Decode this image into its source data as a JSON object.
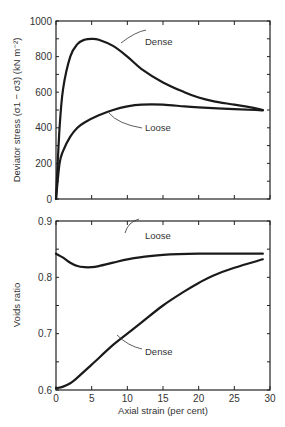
{
  "chart_data": [
    {
      "type": "line",
      "title": "",
      "xlabel": "",
      "ylabel": "Deviator stress (σ1 − σ3) (kN m⁻²)",
      "xlim": [
        0,
        30
      ],
      "ylim": [
        0,
        1000
      ],
      "yticks": [
        "0",
        "200",
        "400",
        "600",
        "800",
        "1000"
      ],
      "grid": false,
      "series": [
        {
          "name": "Dense",
          "x": [
            0,
            0.5,
            1,
            2,
            3,
            4,
            5,
            6,
            8,
            10,
            12,
            15,
            18,
            20,
            22,
            25,
            28,
            29
          ],
          "y": [
            0,
            400,
            620,
            800,
            870,
            895,
            900,
            895,
            860,
            800,
            730,
            655,
            600,
            570,
            550,
            530,
            510,
            500
          ]
        },
        {
          "name": "Loose",
          "x": [
            0,
            0.5,
            1,
            2,
            3,
            4,
            6,
            8,
            10,
            12,
            15,
            18,
            20,
            25,
            28,
            29
          ],
          "y": [
            0,
            200,
            270,
            350,
            400,
            430,
            470,
            500,
            520,
            530,
            530,
            520,
            515,
            505,
            500,
            498
          ]
        }
      ],
      "annotations": [
        "Dense",
        "Loose"
      ]
    },
    {
      "type": "line",
      "title": "",
      "xlabel": "Axial strain (per cent)",
      "ylabel": "Voids ratio",
      "xlim": [
        0,
        30
      ],
      "ylim": [
        0.6,
        0.9
      ],
      "xticks": [
        "0",
        "5",
        "10",
        "15",
        "20",
        "25",
        "30"
      ],
      "yticks": [
        "0.6",
        "0.7",
        "0.8",
        "0.9"
      ],
      "grid": false,
      "series": [
        {
          "name": "Loose",
          "x": [
            0,
            1,
            2,
            3,
            4,
            5,
            6,
            8,
            10,
            12,
            15,
            20,
            25,
            29
          ],
          "y": [
            0.842,
            0.835,
            0.826,
            0.82,
            0.818,
            0.818,
            0.82,
            0.826,
            0.832,
            0.836,
            0.84,
            0.842,
            0.842,
            0.842
          ]
        },
        {
          "name": "Dense",
          "x": [
            0,
            1,
            2,
            3,
            5,
            8,
            10,
            12,
            15,
            18,
            20,
            22,
            25,
            29
          ],
          "y": [
            0.603,
            0.606,
            0.612,
            0.622,
            0.645,
            0.68,
            0.7,
            0.72,
            0.75,
            0.775,
            0.79,
            0.803,
            0.817,
            0.832
          ]
        }
      ],
      "annotations": [
        "Loose",
        "Dense"
      ]
    }
  ],
  "labels": {
    "top_ylabel": "Deviator stress (σ1 − σ3) (kN m⁻²)",
    "bottom_ylabel": "Voids ratio",
    "xlabel": "Axial strain (per cent)",
    "dense": "Dense",
    "loose": "Loose"
  }
}
